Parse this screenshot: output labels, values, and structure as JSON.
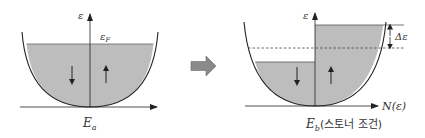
{
  "diagram": {
    "colors": {
      "fill": "#bdbdbd",
      "line": "#222222",
      "arrow": "#8a8a8a"
    },
    "left": {
      "y_axis_label": "ε",
      "fermi_label": "ε",
      "fermi_sub": "F",
      "spin_down_glyph": "↓",
      "spin_up_glyph": "↑",
      "caption_main": "E",
      "caption_sub": "a"
    },
    "transition_arrow": "right-arrow",
    "right": {
      "y_axis_label": "ε",
      "x_axis_label": "N(ε)",
      "shift_label": "Δε",
      "spin_down_glyph": "↓",
      "spin_up_glyph": "↑",
      "caption_main": "E",
      "caption_sub": "b",
      "caption_note": "(스토너 조건)"
    },
    "left_x_axis_label": "N(ε)"
  }
}
